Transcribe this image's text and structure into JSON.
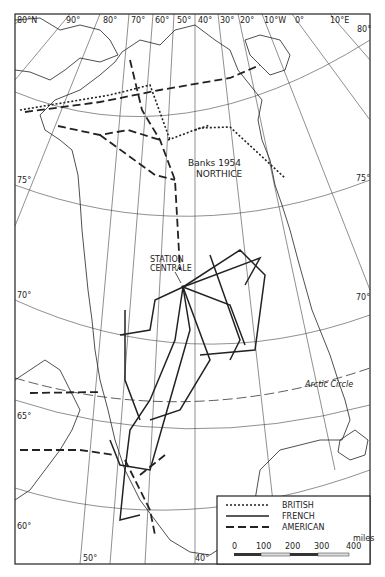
{
  "map": {
    "title": "Greenland ice sheet traverse routes",
    "longitude_labels_top": [
      "80°N",
      "90°",
      "80°",
      "70°",
      "60°",
      "50°",
      "40°",
      "30°",
      "20°",
      "10°W",
      "0°",
      "10°E"
    ],
    "corner_label": "80°",
    "latitude_labels_left": [
      "75°",
      "70°",
      "65°",
      "60°"
    ],
    "latitude_labels_right": [
      "75°",
      "70°"
    ],
    "longitude_labels_bottom": [
      "50°",
      "40°"
    ],
    "annotations": {
      "banks": "Banks 1954",
      "northice": "NORTHICE",
      "station_line1": "STATION",
      "station_line2": "CENTRALE",
      "arctic_circle": "Arctic Circle"
    }
  },
  "legend": {
    "items": [
      {
        "label": "BRITISH",
        "style": "dotted"
      },
      {
        "label": "FRENCH",
        "style": "solid"
      },
      {
        "label": "AMERICAN",
        "style": "dashed"
      }
    ],
    "scale": {
      "unit": "miles",
      "ticks": [
        "0",
        "100",
        "200",
        "300",
        "400"
      ]
    }
  }
}
